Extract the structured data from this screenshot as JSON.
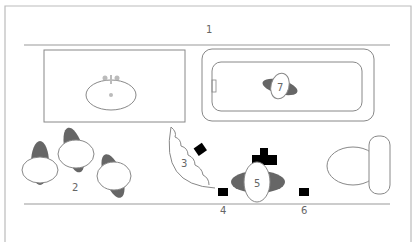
{
  "diagram": {
    "type": "floor-plan",
    "labels": {
      "wall_top": "1",
      "people_group": "2",
      "shower_curtain": "3",
      "stool_left": "4",
      "person_center": "5",
      "stool_right": "6",
      "person_in_tub": "7"
    },
    "colors": {
      "line": "#999999",
      "shadow": "#666666",
      "fill_black": "#000000",
      "background": "#ffffff"
    }
  }
}
